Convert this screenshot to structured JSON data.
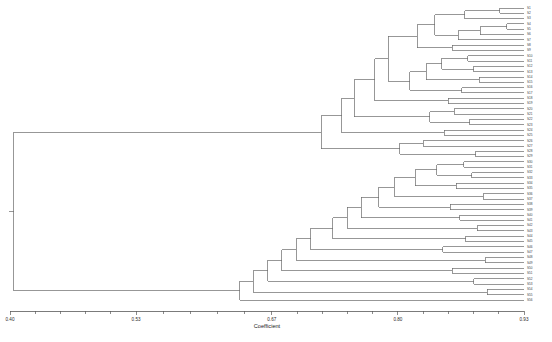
{
  "chart_data": {
    "type": "dendrogram",
    "title": "",
    "xlabel": "Coefficient",
    "ylabel": "",
    "xlim": [
      0.4,
      0.93
    ],
    "grid": false,
    "legend": null,
    "orientation": "horizontal-right",
    "tick_labels": [
      "0.40",
      "0.53",
      "0.67",
      "0.80",
      "0.93"
    ],
    "tick_values": [
      0.4,
      0.53,
      0.67,
      0.8,
      0.93
    ],
    "minor_ticks_per_interval": 4,
    "n_leaves": 56,
    "leaf_labels": [
      "S1",
      "S2",
      "S3",
      "S4",
      "S5",
      "S6",
      "S7",
      "S8",
      "S9",
      "S10",
      "S11",
      "S12",
      "S13",
      "S14",
      "S15",
      "S16",
      "S17",
      "S18",
      "S19",
      "S20",
      "S21",
      "S22",
      "S23",
      "S24",
      "S25",
      "S26",
      "S27",
      "S28",
      "S29",
      "S30",
      "S31",
      "S32",
      "S33",
      "S34",
      "S35",
      "S36",
      "S37",
      "S38",
      "S39",
      "S40",
      "S41",
      "S42",
      "S43",
      "S44",
      "S45",
      "S46",
      "S47",
      "S48",
      "S49",
      "S50",
      "S51",
      "S52",
      "S53",
      "S54",
      "S55",
      "S56"
    ],
    "root_coefficient": 0.404,
    "merges": [
      {
        "id": "n1",
        "left": "L0",
        "right": "L1",
        "height": 0.905
      },
      {
        "id": "n2",
        "left": "n1",
        "right": "L2",
        "height": 0.869
      },
      {
        "id": "n3",
        "left": "L3",
        "right": "L4",
        "height": 0.912
      },
      {
        "id": "n4",
        "left": "n3",
        "right": "L5",
        "height": 0.885
      },
      {
        "id": "n5",
        "left": "n4",
        "right": "L6",
        "height": 0.862
      },
      {
        "id": "n6",
        "left": "n2",
        "right": "n5",
        "height": 0.838
      },
      {
        "id": "n7",
        "left": "L7",
        "right": "L8",
        "height": 0.856
      },
      {
        "id": "n8",
        "left": "n6",
        "right": "n7",
        "height": 0.82
      },
      {
        "id": "n9",
        "left": "L9",
        "right": "L10",
        "height": 0.872
      },
      {
        "id": "n10",
        "left": "L11",
        "right": "L12",
        "height": 0.878
      },
      {
        "id": "n11",
        "left": "n9",
        "right": "n10",
        "height": 0.845
      },
      {
        "id": "n12",
        "left": "L13",
        "right": "L14",
        "height": 0.884
      },
      {
        "id": "n13",
        "left": "n11",
        "right": "n12",
        "height": 0.829
      },
      {
        "id": "n14",
        "left": "L15",
        "right": "L16",
        "height": 0.866
      },
      {
        "id": "n15",
        "left": "n13",
        "right": "n14",
        "height": 0.812
      },
      {
        "id": "n16",
        "left": "n8",
        "right": "n15",
        "height": 0.79
      },
      {
        "id": "n17",
        "left": "L17",
        "right": "L18",
        "height": 0.852
      },
      {
        "id": "n18",
        "left": "n16",
        "right": "n17",
        "height": 0.776
      },
      {
        "id": "n19",
        "left": "L19",
        "right": "L20",
        "height": 0.858
      },
      {
        "id": "n20",
        "left": "L21",
        "right": "L22",
        "height": 0.874
      },
      {
        "id": "n21",
        "left": "n19",
        "right": "n20",
        "height": 0.833
      },
      {
        "id": "n22",
        "left": "n18",
        "right": "n21",
        "height": 0.755
      },
      {
        "id": "n23",
        "left": "L23",
        "right": "L24",
        "height": 0.848
      },
      {
        "id": "n24",
        "left": "n22",
        "right": "n23",
        "height": 0.742
      },
      {
        "id": "n25",
        "left": "L25",
        "right": "L26",
        "height": 0.826
      },
      {
        "id": "n26",
        "left": "L27",
        "right": "L28",
        "height": 0.88
      },
      {
        "id": "n27",
        "left": "n25",
        "right": "n26",
        "height": 0.802
      },
      {
        "id": "n28",
        "left": "n24",
        "right": "n27",
        "height": 0.721
      },
      {
        "id": "n29",
        "left": "L29",
        "right": "L30",
        "height": 0.868
      },
      {
        "id": "n30",
        "left": "L31",
        "right": "L32",
        "height": 0.876
      },
      {
        "id": "n31",
        "left": "n29",
        "right": "n30",
        "height": 0.84
      },
      {
        "id": "n32",
        "left": "L33",
        "right": "L34",
        "height": 0.86
      },
      {
        "id": "n33",
        "left": "n31",
        "right": "n32",
        "height": 0.818
      },
      {
        "id": "n34",
        "left": "L35",
        "right": "L36",
        "height": 0.888
      },
      {
        "id": "n35",
        "left": "n33",
        "right": "n34",
        "height": 0.796
      },
      {
        "id": "n36",
        "left": "L37",
        "right": "L38",
        "height": 0.854
      },
      {
        "id": "n37",
        "left": "n35",
        "right": "n36",
        "height": 0.78
      },
      {
        "id": "n38",
        "left": "L39",
        "right": "L40",
        "height": 0.864
      },
      {
        "id": "n39",
        "left": "n37",
        "right": "n38",
        "height": 0.762
      },
      {
        "id": "n40",
        "left": "L41",
        "right": "L42",
        "height": 0.882
      },
      {
        "id": "n41",
        "left": "n39",
        "right": "n40",
        "height": 0.748
      },
      {
        "id": "n42",
        "left": "L43",
        "right": "L44",
        "height": 0.87
      },
      {
        "id": "n43",
        "left": "n41",
        "right": "n42",
        "height": 0.733
      },
      {
        "id": "n44",
        "left": "L45",
        "right": "L46",
        "height": 0.846
      },
      {
        "id": "n45",
        "left": "n43",
        "right": "n44",
        "height": 0.71
      },
      {
        "id": "n46",
        "left": "L47",
        "right": "L48",
        "height": 0.89
      },
      {
        "id": "n47",
        "left": "n45",
        "right": "n46",
        "height": 0.695
      },
      {
        "id": "n48",
        "left": "L49",
        "right": "L50",
        "height": 0.856
      },
      {
        "id": "n49",
        "left": "n47",
        "right": "n48",
        "height": 0.68
      },
      {
        "id": "n50",
        "left": "L51",
        "right": "L52",
        "height": 0.878
      },
      {
        "id": "n51",
        "left": "n49",
        "right": "n50",
        "height": 0.666
      },
      {
        "id": "n52",
        "left": "L53",
        "right": "L54",
        "height": 0.892
      },
      {
        "id": "n53",
        "left": "n51",
        "right": "n52",
        "height": 0.651
      },
      {
        "id": "n54",
        "left": "n53",
        "right": "L55",
        "height": 0.637
      },
      {
        "id": "n55",
        "left": "n28",
        "right": "n54",
        "height": 0.404
      }
    ]
  },
  "caption": {
    "text": ""
  }
}
